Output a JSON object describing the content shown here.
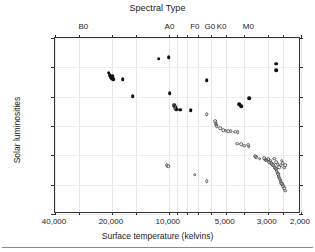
{
  "chart_data": {
    "type": "scatter",
    "title": "Spectral Type",
    "xlabel": "Surface temperature (kelvins)",
    "ylabel": "Solar luminosities",
    "xscale": "log-reversed",
    "yscale": "log",
    "xlim": [
      40000,
      2000
    ],
    "ylim": [
      1e-06,
      1000000.0
    ],
    "grid": true,
    "legend": "none",
    "xticks": [
      {
        "value": 40000,
        "label": "40,000"
      },
      {
        "value": 20000,
        "label": "20,000"
      },
      {
        "value": 10000,
        "label": "10,000"
      },
      {
        "value": 5000,
        "label": "5,000"
      },
      {
        "value": 3000,
        "label": "3,000"
      },
      {
        "value": 2000,
        "label": "2,000"
      }
    ],
    "xminorticks": [
      30000,
      15000,
      9000,
      8000,
      7000,
      6000,
      4000,
      2500
    ],
    "yticks": [
      {
        "value": 1000000.0,
        "mantissa": "10",
        "exponent": "6"
      },
      {
        "value": 10000.0,
        "mantissa": "10",
        "exponent": "4"
      },
      {
        "value": 100.0,
        "mantissa": "10",
        "exponent": "2"
      },
      {
        "value": 1,
        "mantissa": "1",
        "exponent": ""
      },
      {
        "value": 0.01,
        "mantissa": "10",
        "exponent": "-2"
      },
      {
        "value": 0.0001,
        "mantissa": "10",
        "exponent": "-4"
      },
      {
        "value": 1e-06,
        "mantissa": "10",
        "exponent": "-6"
      }
    ],
    "spectral_types": [
      {
        "label": "B0",
        "temperature": 28000
      },
      {
        "label": "A0",
        "temperature": 9800
      },
      {
        "label": "F0",
        "temperature": 7200
      },
      {
        "label": "G0",
        "temperature": 6000
      },
      {
        "label": "K0",
        "temperature": 5200
      },
      {
        "label": "M0",
        "temperature": 3750
      }
    ],
    "series": [
      {
        "name": "giants-and-supergiants",
        "marker": "filled-circle",
        "color": "#111111",
        "points": [
          {
            "t": 20800,
            "l": 4200
          },
          {
            "t": 20500,
            "l": 2900
          },
          {
            "t": 20300,
            "l": 2100
          },
          {
            "t": 20100,
            "l": 1800
          },
          {
            "t": 19900,
            "l": 2600
          },
          {
            "t": 19700,
            "l": 1500
          },
          {
            "t": 17500,
            "l": 1600
          },
          {
            "t": 15500,
            "l": 105
          },
          {
            "t": 11300,
            "l": 39000
          },
          {
            "t": 10000,
            "l": 48000
          },
          {
            "t": 9900,
            "l": 165
          },
          {
            "t": 9400,
            "l": 26
          },
          {
            "t": 9250,
            "l": 21
          },
          {
            "t": 9150,
            "l": 14
          },
          {
            "t": 8700,
            "l": 13
          },
          {
            "t": 7650,
            "l": 12
          },
          {
            "t": 6300,
            "l": 1350
          },
          {
            "t": 4250,
            "l": 30
          },
          {
            "t": 4150,
            "l": 23
          },
          {
            "t": 3750,
            "l": 79
          },
          {
            "t": 2700,
            "l": 18000
          },
          {
            "t": 2700,
            "l": 6500
          }
        ]
      },
      {
        "name": "main-sequence-and-white-dwarfs",
        "marker": "open-circle",
        "color": "#5c5c5c",
        "points": [
          {
            "t": 9350,
            "l": 23
          },
          {
            "t": 9300,
            "l": 17
          },
          {
            "t": 6300,
            "l": 6.2
          },
          {
            "t": 5700,
            "l": 2.1
          },
          {
            "t": 5650,
            "l": 1.5
          },
          {
            "t": 5600,
            "l": 1.2
          },
          {
            "t": 5580,
            "l": 1.0
          },
          {
            "t": 5350,
            "l": 0.72
          },
          {
            "t": 5150,
            "l": 0.52
          },
          {
            "t": 5000,
            "l": 0.48
          },
          {
            "t": 4850,
            "l": 0.45
          },
          {
            "t": 4700,
            "l": 0.43
          },
          {
            "t": 4450,
            "l": 0.4
          },
          {
            "t": 4350,
            "l": 0.062
          },
          {
            "t": 4330,
            "l": 0.38
          },
          {
            "t": 4150,
            "l": 0.06
          },
          {
            "t": 4000,
            "l": 0.046
          },
          {
            "t": 3800,
            "l": 0.052
          },
          {
            "t": 3780,
            "l": 0.04
          },
          {
            "t": 3500,
            "l": 0.0088
          },
          {
            "t": 3450,
            "l": 0.0072
          },
          {
            "t": 3300,
            "l": 0.0058
          },
          {
            "t": 3120,
            "l": 0.0062
          },
          {
            "t": 3100,
            "l": 0.005
          },
          {
            "t": 3050,
            "l": 0.0046
          },
          {
            "t": 2980,
            "l": 0.0052
          },
          {
            "t": 2950,
            "l": 0.0034
          },
          {
            "t": 2900,
            "l": 0.0044
          },
          {
            "t": 2870,
            "l": 0.003
          },
          {
            "t": 2840,
            "l": 0.0026
          },
          {
            "t": 2800,
            "l": 0.0021
          },
          {
            "t": 2780,
            "l": 0.006
          },
          {
            "t": 2750,
            "l": 0.0016
          },
          {
            "t": 2730,
            "l": 0.0013
          },
          {
            "t": 2700,
            "l": 0.0011
          },
          {
            "t": 2690,
            "l": 0.00085
          },
          {
            "t": 2660,
            "l": 0.00066
          },
          {
            "t": 2640,
            "l": 0.0005
          },
          {
            "t": 2620,
            "l": 0.00038
          },
          {
            "t": 2600,
            "l": 0.0003
          },
          {
            "t": 2580,
            "l": 0.00022
          },
          {
            "t": 2560,
            "l": 0.00017
          },
          {
            "t": 2540,
            "l": 0.00013
          },
          {
            "t": 2510,
            "l": 0.000105
          },
          {
            "t": 2480,
            "l": 8e-05
          },
          {
            "t": 2450,
            "l": 5.5e-05
          },
          {
            "t": 2420,
            "l": 4e-05
          },
          {
            "t": 2420,
            "l": 0.0022
          },
          {
            "t": 2460,
            "l": 0.0014
          },
          {
            "t": 2500,
            "l": 0.003
          },
          {
            "t": 2530,
            "l": 0.0042
          },
          {
            "t": 2560,
            "l": 0.0022
          },
          {
            "t": 2600,
            "l": 0.0015
          },
          {
            "t": 2650,
            "l": 0.0024
          },
          {
            "t": 2710,
            "l": 0.0034
          },
          {
            "t": 10250,
            "l": 0.0021
          },
          {
            "t": 10050,
            "l": 0.0018
          },
          {
            "t": 7300,
            "l": 0.00048
          },
          {
            "t": 6300,
            "l": 0.00018
          }
        ]
      }
    ]
  }
}
